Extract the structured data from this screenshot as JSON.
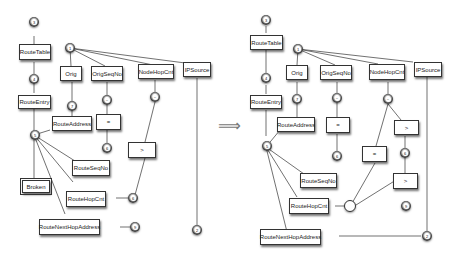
{
  "transition_arrow": "⟹",
  "left": {
    "boxes": {
      "route_table": "RouteTable",
      "route_entry": "RouteEntry",
      "orig": "Orig",
      "orig_seq_no": "OrigSeqNo",
      "node_hop_cnt": "NodeHopCnt",
      "ip_source": "IPSource",
      "route_address": "RouteAddress",
      "eq": "=",
      "gt": ">",
      "route_seq_no": "RouteSeqNo",
      "broken": "Broken",
      "route_hop_cnt": "RouteHopCnt",
      "route_next_hop_address": "RouteNextHopAddress"
    },
    "circles": {
      "c3": "3",
      "c4": "4",
      "c5": "5",
      "c1": "1",
      "c7": "7",
      "c_orig_seq": "~",
      "c_node_hop": "~",
      "c6a": "6",
      "c6b": "6",
      "c9": "9",
      "c2": "2"
    }
  },
  "right": {
    "boxes": {
      "route_table": "RouteTable",
      "route_entry": "RouteEntry",
      "orig": "Orig",
      "orig_seq_no": "OrigSeqNo",
      "node_hop_cnt": "NodeHopCnt",
      "ip_source": "IPSource",
      "route_address": "RouteAddress",
      "eq1": "=",
      "eq2": "=",
      "gt1": ">",
      "gt2": ">",
      "route_seq_no": "RouteSeqNo",
      "route_hop_cnt": "RouteHopCnt",
      "route_next_hop_address": "RouteNextHopAddress"
    },
    "circles": {
      "c3": "3",
      "c4": "4",
      "c5": "5",
      "c1": "1",
      "c7": "7",
      "c_orig_seq": "~",
      "c_node_hop": "~",
      "c6a": "6",
      "c6b": "6",
      "c9": "9",
      "c2": "2"
    }
  },
  "edge_labels": {
    "zero": "0",
    "one": "1"
  }
}
